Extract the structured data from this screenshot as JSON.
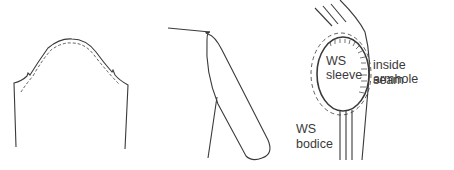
{
  "figures": [
    {
      "id": "sleeve-cap-pattern",
      "description": "Sleeve pattern with cap curve and dashed stitching line"
    },
    {
      "id": "sleeve-side-view",
      "description": "Sleeve attached to bodice, side view"
    },
    {
      "id": "armhole-seam-detail",
      "description": "Sleeve set into armhole, inside view"
    }
  ],
  "labels": {
    "ws_sleeve_line1": "WS",
    "ws_sleeve_line2": "sleeve",
    "inside_armhole_line1": "inside armhole",
    "inside_armhole_line2": "seam",
    "ws_bodice_line1": "WS",
    "ws_bodice_line2": "bodice"
  },
  "colors": {
    "stroke": "#3a3a3a",
    "background": "#ffffff"
  }
}
